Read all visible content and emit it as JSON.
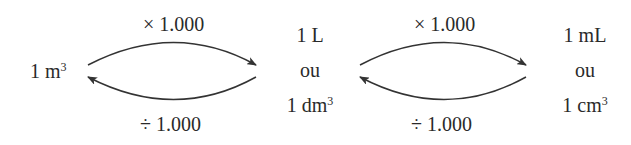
{
  "diagram": {
    "title": "",
    "nodes": [
      {
        "id": "m3",
        "lines": [
          {
            "text": "1 m",
            "sup": "3"
          }
        ]
      },
      {
        "id": "L",
        "lines": [
          {
            "text": "1 L",
            "sup": ""
          },
          {
            "text": "ou",
            "sup": ""
          },
          {
            "text": "1 dm",
            "sup": "3"
          }
        ]
      },
      {
        "id": "mL",
        "lines": [
          {
            "text": "1 mL",
            "sup": ""
          },
          {
            "text": "ou",
            "sup": ""
          },
          {
            "text": "1 cm",
            "sup": "3"
          }
        ]
      }
    ],
    "edges": [
      {
        "from": "m3",
        "to": "L",
        "label": "× 1.000"
      },
      {
        "from": "L",
        "to": "m3",
        "label": "÷ 1.000"
      },
      {
        "from": "L",
        "to": "mL",
        "label": "× 1.000"
      },
      {
        "from": "mL",
        "to": "L",
        "label": "÷ 1.000"
      }
    ],
    "colors": {
      "stroke": "#333333",
      "text": "#2a2a2a"
    }
  }
}
